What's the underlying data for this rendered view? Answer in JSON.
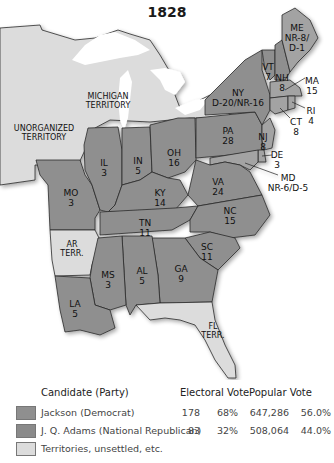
{
  "title": "1828",
  "colors": {
    "jackson": "#8f8f8f",
    "adams": "#a3a3a3",
    "territory": "#dcdcdc",
    "water": "#ffffff",
    "border": "#2a2a2a"
  },
  "regions": {
    "michigan": "MICHIGAN\nTERRITORY",
    "unorganized": "UNORGANIZED\nTERRITORY",
    "ar": "AR\nTERR.",
    "fl": "FL\nTERR."
  },
  "states": [
    {
      "abbr": "ME",
      "votes": "NR-8/\nD-1"
    },
    {
      "abbr": "VT",
      "votes": "7"
    },
    {
      "abbr": "NH",
      "votes": "8"
    },
    {
      "abbr": "MA",
      "votes": "15"
    },
    {
      "abbr": "RI",
      "votes": "4"
    },
    {
      "abbr": "CT",
      "votes": "8"
    },
    {
      "abbr": "NY",
      "votes": "D-20/NR-16"
    },
    {
      "abbr": "NJ",
      "votes": "8"
    },
    {
      "abbr": "DE",
      "votes": "3"
    },
    {
      "abbr": "MD",
      "votes": "NR-6/D-5"
    },
    {
      "abbr": "PA",
      "votes": "28"
    },
    {
      "abbr": "OH",
      "votes": "16"
    },
    {
      "abbr": "IN",
      "votes": "5"
    },
    {
      "abbr": "IL",
      "votes": "3"
    },
    {
      "abbr": "MO",
      "votes": "3"
    },
    {
      "abbr": "KY",
      "votes": "14"
    },
    {
      "abbr": "VA",
      "votes": "24"
    },
    {
      "abbr": "NC",
      "votes": "15"
    },
    {
      "abbr": "TN",
      "votes": "11"
    },
    {
      "abbr": "SC",
      "votes": "11"
    },
    {
      "abbr": "GA",
      "votes": "9"
    },
    {
      "abbr": "AL",
      "votes": "5"
    },
    {
      "abbr": "MS",
      "votes": "3"
    },
    {
      "abbr": "LA",
      "votes": "5"
    }
  ],
  "legend": {
    "headers": {
      "candidate": "Candidate (Party)",
      "electoral": "Electoral Vote",
      "popular": "Popular Vote"
    },
    "rows": [
      {
        "label": "Jackson (Democrat)",
        "ev": "178",
        "ev_pct": "68%",
        "pv": "647,286",
        "pv_pct": "56.0%"
      },
      {
        "label": "J. Q. Adams (National Republican)",
        "ev": "83",
        "ev_pct": "32%",
        "pv": "508,064",
        "pv_pct": "44.0%"
      },
      {
        "label": "Territories, unsettled, etc."
      }
    ]
  }
}
